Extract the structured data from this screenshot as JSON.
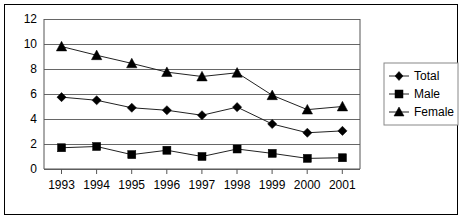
{
  "chart_data": {
    "type": "line",
    "title": "",
    "xlabel": "",
    "ylabel": "",
    "categories": [
      "1993",
      "1994",
      "1995",
      "1996",
      "1997",
      "1998",
      "1999",
      "2000",
      "2001"
    ],
    "ylim": [
      0,
      12
    ],
    "y_ticks": [
      "0",
      "2",
      "4",
      "6",
      "8",
      "10",
      "12"
    ],
    "grid": true,
    "legend_position": "right",
    "series": [
      {
        "name": "Total",
        "marker": "diamond",
        "values": [
          5.75,
          5.5,
          4.9,
          4.7,
          4.3,
          4.95,
          3.6,
          2.9,
          3.05
        ]
      },
      {
        "name": "Male",
        "marker": "square",
        "values": [
          1.7,
          1.8,
          1.15,
          1.5,
          1.0,
          1.6,
          1.25,
          0.85,
          0.9
        ]
      },
      {
        "name": "Female",
        "marker": "triangle",
        "values": [
          9.8,
          9.1,
          8.45,
          7.75,
          7.4,
          7.7,
          5.9,
          4.75,
          5.0
        ]
      }
    ]
  },
  "axis": {
    "y_labels": [
      "12",
      "10",
      "8",
      "6",
      "4",
      "2",
      "0"
    ],
    "x_labels": [
      "1993",
      "1994",
      "1995",
      "1996",
      "1997",
      "1998",
      "1999",
      "2000",
      "2001"
    ]
  },
  "legend": {
    "entries": [
      {
        "label": "Total",
        "marker": "diamond"
      },
      {
        "label": "Male",
        "marker": "square"
      },
      {
        "label": "Female",
        "marker": "triangle"
      }
    ]
  },
  "colors": {
    "series": "#000000",
    "grid": "#666666",
    "axis": "#555555",
    "frame": "#000000",
    "background": "#ffffff"
  }
}
